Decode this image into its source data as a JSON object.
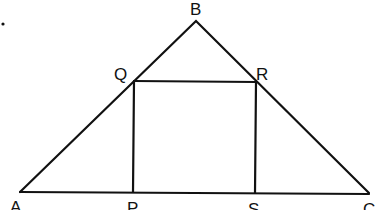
{
  "diagram": {
    "stroke_color": "#111111",
    "background": "#ffffff",
    "points": {
      "A": {
        "label": "A",
        "x": 20,
        "y": 192
      },
      "B": {
        "label": "B",
        "x": 196,
        "y": 21
      },
      "C": {
        "label": "C",
        "x": 369,
        "y": 193
      },
      "P": {
        "label": "P",
        "x": 134,
        "y": 192
      },
      "Q": {
        "label": "Q",
        "x": 134,
        "y": 81
      },
      "R": {
        "label": "R",
        "x": 256,
        "y": 82
      },
      "S": {
        "label": "S",
        "x": 255,
        "y": 193
      }
    },
    "segments": [
      "AB",
      "BC",
      "AC",
      "QR",
      "QP",
      "RS"
    ],
    "marks": [
      {
        "type": "dot",
        "x": 3,
        "y": 24
      }
    ]
  }
}
